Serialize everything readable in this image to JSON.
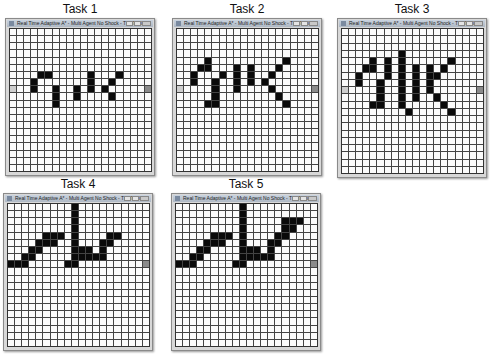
{
  "figure": {
    "grid_cols": 20,
    "grid_rows": 20,
    "window_title": "Real Time Adaptive A* - Multi Agent No Shock - TESTING",
    "tasks": [
      {
        "label": "Task 1",
        "x": 5,
        "y": 18,
        "w": 150,
        "h": 158,
        "start": [
          0,
          8
        ],
        "goal": [
          19,
          8
        ],
        "obstacles": [
          [
            4,
            6
          ],
          [
            5,
            6
          ],
          [
            3,
            7
          ],
          [
            3,
            8
          ],
          [
            6,
            8
          ],
          [
            6,
            9
          ],
          [
            6,
            10
          ],
          [
            9,
            8
          ],
          [
            9,
            9
          ],
          [
            11,
            6
          ],
          [
            11,
            7
          ],
          [
            11,
            8
          ],
          [
            15,
            6
          ],
          [
            14,
            7
          ],
          [
            13,
            8
          ],
          [
            14,
            9
          ]
        ]
      },
      {
        "label": "Task 2",
        "x": 172,
        "y": 18,
        "w": 150,
        "h": 158,
        "start": [
          0,
          8
        ],
        "goal": [
          19,
          8
        ],
        "obstacles": [
          [
            4,
            4
          ],
          [
            4,
            5
          ],
          [
            3,
            5
          ],
          [
            2,
            6
          ],
          [
            2,
            7
          ],
          [
            6,
            6
          ],
          [
            5,
            7
          ],
          [
            5,
            8
          ],
          [
            5,
            9
          ],
          [
            5,
            10
          ],
          [
            4,
            10
          ],
          [
            8,
            5
          ],
          [
            8,
            6
          ],
          [
            8,
            7
          ],
          [
            8,
            8
          ],
          [
            10,
            5
          ],
          [
            10,
            6
          ],
          [
            10,
            7
          ],
          [
            15,
            4
          ],
          [
            14,
            5
          ],
          [
            13,
            6
          ],
          [
            12,
            7
          ],
          [
            13,
            8
          ],
          [
            14,
            9
          ],
          [
            15,
            10
          ]
        ]
      },
      {
        "label": "Task 3",
        "x": 337,
        "y": 18,
        "w": 150,
        "h": 160,
        "start": [
          0,
          8
        ],
        "goal": [
          19,
          8
        ],
        "obstacles": [
          [
            4,
            4
          ],
          [
            4,
            5
          ],
          [
            3,
            5
          ],
          [
            2,
            6
          ],
          [
            2,
            7
          ],
          [
            6,
            4
          ],
          [
            6,
            5
          ],
          [
            6,
            6
          ],
          [
            5,
            7
          ],
          [
            5,
            8
          ],
          [
            5,
            9
          ],
          [
            5,
            10
          ],
          [
            4,
            10
          ],
          [
            8,
            3
          ],
          [
            8,
            4
          ],
          [
            8,
            5
          ],
          [
            8,
            6
          ],
          [
            8,
            7
          ],
          [
            8,
            8
          ],
          [
            8,
            9
          ],
          [
            8,
            10
          ],
          [
            9,
            11
          ],
          [
            10,
            5
          ],
          [
            10,
            6
          ],
          [
            10,
            7
          ],
          [
            10,
            8
          ],
          [
            10,
            9
          ],
          [
            12,
            5
          ],
          [
            12,
            6
          ],
          [
            12,
            7
          ],
          [
            12,
            8
          ],
          [
            15,
            4
          ],
          [
            14,
            5
          ],
          [
            13,
            6
          ],
          [
            13,
            9
          ],
          [
            14,
            10
          ],
          [
            15,
            11
          ]
        ]
      },
      {
        "label": "Task 4",
        "x": 3,
        "y": 193,
        "w": 150,
        "h": 158,
        "start": [
          0,
          8
        ],
        "goal": [
          19,
          8
        ],
        "obstacles": [
          [
            9,
            0
          ],
          [
            9,
            1
          ],
          [
            9,
            2
          ],
          [
            9,
            3
          ],
          [
            9,
            4
          ],
          [
            9,
            5
          ],
          [
            9,
            6
          ],
          [
            5,
            4
          ],
          [
            6,
            4
          ],
          [
            7,
            4
          ],
          [
            4,
            5
          ],
          [
            5,
            5
          ],
          [
            6,
            5
          ],
          [
            3,
            6
          ],
          [
            4,
            6
          ],
          [
            2,
            7
          ],
          [
            3,
            7
          ],
          [
            0,
            8
          ],
          [
            1,
            8
          ],
          [
            2,
            8
          ],
          [
            10,
            6
          ],
          [
            11,
            6
          ],
          [
            14,
            4
          ],
          [
            15,
            4
          ],
          [
            13,
            5
          ],
          [
            14,
            5
          ],
          [
            13,
            6
          ],
          [
            9,
            7
          ],
          [
            10,
            7
          ],
          [
            11,
            7
          ],
          [
            12,
            7
          ],
          [
            13,
            7
          ],
          [
            8,
            8
          ],
          [
            9,
            8
          ]
        ]
      },
      {
        "label": "Task 5",
        "x": 171,
        "y": 193,
        "w": 150,
        "h": 158,
        "start": [
          0,
          8
        ],
        "goal": [
          19,
          8
        ],
        "obstacles": [
          [
            9,
            0
          ],
          [
            9,
            1
          ],
          [
            9,
            2
          ],
          [
            9,
            3
          ],
          [
            9,
            4
          ],
          [
            9,
            5
          ],
          [
            9,
            6
          ],
          [
            5,
            4
          ],
          [
            6,
            4
          ],
          [
            7,
            4
          ],
          [
            4,
            5
          ],
          [
            5,
            5
          ],
          [
            6,
            5
          ],
          [
            3,
            6
          ],
          [
            4,
            6
          ],
          [
            2,
            7
          ],
          [
            3,
            7
          ],
          [
            0,
            8
          ],
          [
            1,
            8
          ],
          [
            2,
            8
          ],
          [
            10,
            6
          ],
          [
            11,
            6
          ],
          [
            15,
            2
          ],
          [
            16,
            2
          ],
          [
            17,
            2
          ],
          [
            15,
            3
          ],
          [
            16,
            3
          ],
          [
            14,
            4
          ],
          [
            15,
            4
          ],
          [
            13,
            5
          ],
          [
            14,
            5
          ],
          [
            13,
            6
          ],
          [
            9,
            7
          ],
          [
            10,
            7
          ],
          [
            11,
            7
          ],
          [
            12,
            7
          ],
          [
            13,
            7
          ],
          [
            8,
            8
          ],
          [
            9,
            8
          ]
        ]
      }
    ]
  }
}
